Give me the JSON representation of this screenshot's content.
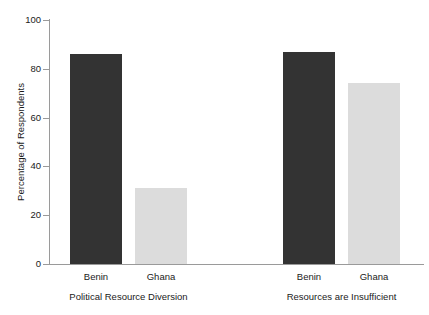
{
  "chart_data": {
    "type": "bar",
    "title": "",
    "xlabel": "",
    "ylabel": "Percentage of Respondents",
    "ylim": [
      0,
      100
    ],
    "yticks": [
      "0",
      "20",
      "40",
      "60",
      "80",
      "100"
    ],
    "ytick_values": [
      0,
      20,
      40,
      60,
      80,
      100
    ],
    "grid": false,
    "legend": "none",
    "categories": [
      "Benin",
      "Ghana"
    ],
    "groups": [
      {
        "label": "Political Resource Diversion",
        "bars": [
          {
            "category": "Benin",
            "value": 86,
            "color": "#333333"
          },
          {
            "category": "Ghana",
            "value": 31,
            "color": "#dcdcdc"
          }
        ]
      },
      {
        "label": "Resources are Insufficient",
        "bars": [
          {
            "category": "Benin",
            "value": 87,
            "color": "#333333"
          },
          {
            "category": "Ghana",
            "value": 74,
            "color": "#dcdcdc"
          }
        ]
      }
    ],
    "series": [
      {
        "name": "Benin",
        "values": [
          86,
          87
        ],
        "color": "#333333"
      },
      {
        "name": "Ghana",
        "values": [
          31,
          74
        ],
        "color": "#dcdcdc"
      }
    ],
    "axis_color": "#9a9a9a",
    "background": "#ffffff"
  },
  "figure": {
    "top_sliver_text": "",
    "y_axis_title": "Percentage of Respondents",
    "y_ticks": [
      {
        "label": "100",
        "value": 100
      },
      {
        "label": "80",
        "value": 80
      },
      {
        "label": "60",
        "value": 60
      },
      {
        "label": "40",
        "value": 40
      },
      {
        "label": "20",
        "value": 20
      },
      {
        "label": "0",
        "value": 0
      }
    ],
    "bars": [
      {
        "name": "benin-political-resource-diversion",
        "label": "Benin",
        "value": 86,
        "tone": "dark"
      },
      {
        "name": "ghana-political-resource-diversion",
        "label": "Ghana",
        "value": 31,
        "tone": "light"
      },
      {
        "name": "benin-resources-are-insufficient",
        "label": "Benin",
        "value": 87,
        "tone": "dark"
      },
      {
        "name": "ghana-resources-are-insufficient",
        "label": "Ghana",
        "value": 74,
        "tone": "light"
      }
    ],
    "group_labels": [
      "Political Resource Diversion",
      "Resources are Insufficient"
    ]
  }
}
